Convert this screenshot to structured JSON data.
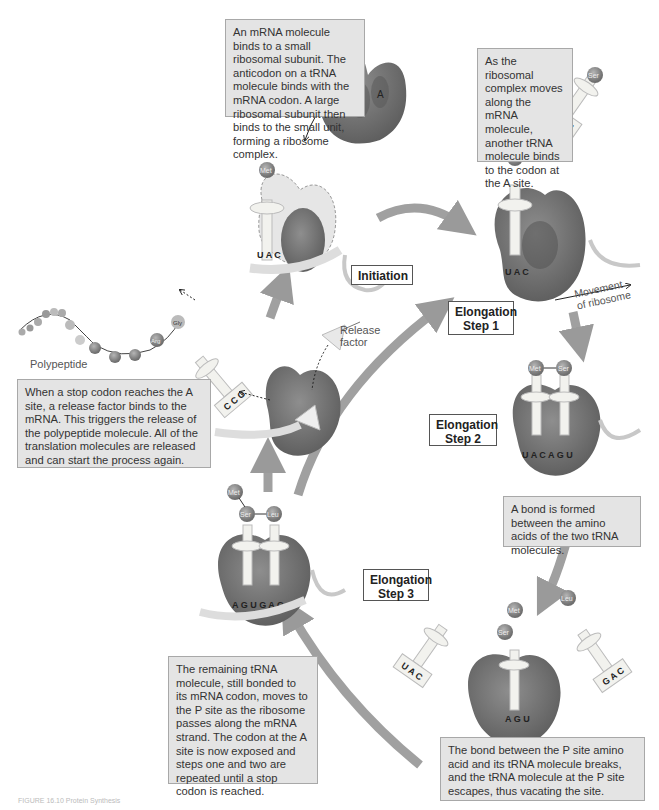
{
  "notes": {
    "initiation": "An mRNA molecule binds to a small ribosomal subunit. The anticodon on a tRNA molecule binds with the mRNA codon. A large ribosomal subunit then binds to the small unit, forming a ribosome complex.",
    "elongation_1": "As the ribosomal complex moves along the mRNA molecule, another tRNA molecule binds to the codon at the A site.",
    "termination": "When a stop codon reaches the A site, a release factor binds to the mRNA. This triggers the release of the polypeptide molecule. All of the translation molecules are released and can start the process again.",
    "elongation_2": "A bond is formed between the amino acids of the two tRNA molecules.",
    "elongation_3": "The remaining tRNA molecule, still bonded to its mRNA codon, moves to the P site as the ribosome passes along the mRNA strand. The codon at the A site is now exposed and steps one and two are repeated until a stop codon is reached.",
    "bond_break": "The bond between the P site amino acid and its tRNA molecule breaks, and the tRNA molecule at the P site escapes, thus vacating the site."
  },
  "stages": {
    "initiation": "Initiation",
    "elong1_line1": "Elongation",
    "elong1_line2": "Step 1",
    "elong2_line1": "Elongation",
    "elong2_line2": "Step 2",
    "elong3_line1": "Elongation",
    "elong3_line2": "Step 3"
  },
  "labels": {
    "polypeptide": "Polypeptide",
    "release_factor_1": "Release",
    "release_factor_2": "factor",
    "movement_1": "Movement",
    "movement_2": "of ribosome",
    "site_p": "P",
    "site_a": "A"
  },
  "amino_acids": {
    "met": "Met",
    "ser": "Ser",
    "leu": "Leu",
    "arg": "Arg",
    "gly": "Gly"
  },
  "anticodons": {
    "initiation": "U A C",
    "elong1_incoming": "A G U",
    "elong1_bound": "U A C",
    "elong2": "U A C A G U",
    "elong3": "A G U G A C",
    "bond_break_left": "U A C",
    "bond_break_right": "G A C",
    "bond_break_center": "A G U",
    "termination": "C C G"
  },
  "mrna": {
    "initiation": "A U G U C A G",
    "elong1": "A U G U C A G",
    "elong2": "A U G U C A G",
    "elong3": "A U G U C A G",
    "termination": "C G A G G C U A A"
  },
  "caption": "FIGURE 16.10 Protein Synthesis",
  "colors": {
    "ribosome": "#7a7a7a",
    "ribosome_dark": "#5a5a5a",
    "trna": "#f2f2ee",
    "arrow": "#9a9a9a",
    "note_bg": "#e4e4e4",
    "amino_acid": "#8c8c8c"
  }
}
